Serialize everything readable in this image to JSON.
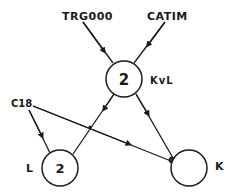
{
  "diagram": {
    "type": "directed-graph",
    "nodes": {
      "trg000": {
        "label": "TRG000"
      },
      "catim": {
        "label": "CATIM"
      },
      "kvl": {
        "label": "KvL",
        "value": "2"
      },
      "c18": {
        "label": "C18"
      },
      "l": {
        "label": "L",
        "value": "2"
      },
      "k": {
        "label": "K",
        "value": ""
      }
    },
    "edges": [
      {
        "from": "TRG000",
        "to": "KvL"
      },
      {
        "from": "CATIM",
        "to": "KvL"
      },
      {
        "from": "KvL",
        "to": "L"
      },
      {
        "from": "KvL",
        "to": "K"
      },
      {
        "from": "C18",
        "to": "L"
      },
      {
        "from": "C18",
        "to": "K"
      }
    ],
    "colors": {
      "ink": "#1a1a1a",
      "background": "#ffffff"
    }
  }
}
